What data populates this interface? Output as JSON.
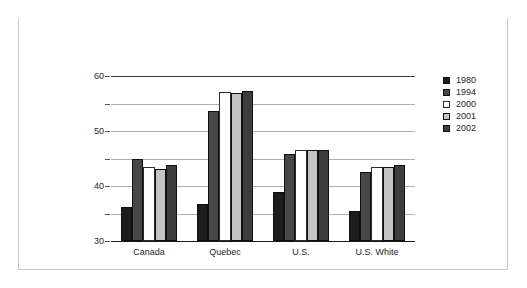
{
  "figure": {
    "title": "Figure 3.3 Out of Wedlock Births (percent of all births to unmarried mothers)"
  },
  "chart_data": {
    "type": "bar",
    "title": "Figure 3.3 Out of Wedlock Births (percent of all births to unmarried mothers)",
    "xlabel": "",
    "ylabel": "",
    "ylim": [
      0,
      60
    ],
    "yticks": [
      0,
      10,
      20,
      30,
      40,
      50,
      60
    ],
    "grid": true,
    "legend_position": "top-right",
    "categories": [
      "Canada",
      "Quebec",
      "U.S.",
      "U.S. White"
    ],
    "series": [
      {
        "name": "1980",
        "color": "#1c1c1c",
        "values": [
          12.5,
          13.3,
          18.0,
          11.0
        ]
      },
      {
        "name": "1994",
        "color": "#474747",
        "values": [
          30.0,
          47.3,
          31.7,
          25.0
        ]
      },
      {
        "name": "2000",
        "color": "#ffffff",
        "values": [
          27.0,
          54.3,
          33.0,
          26.8
        ]
      },
      {
        "name": "2001",
        "color": "#c4c4c4",
        "values": [
          26.2,
          53.7,
          33.0,
          27.0
        ]
      },
      {
        "name": "2002",
        "color": "#3c3c3c",
        "values": [
          27.5,
          54.5,
          33.0,
          27.8
        ]
      }
    ]
  },
  "axis": {
    "tick_labels": [
      "60",
      "50",
      "40",
      "30",
      "20",
      "10",
      "0"
    ]
  },
  "legend": {
    "entries": [
      {
        "label": "1980",
        "color": "#1c1c1c"
      },
      {
        "label": "1994",
        "color": "#474747"
      },
      {
        "label": "2000",
        "color": "#ffffff"
      },
      {
        "label": "2001",
        "color": "#c4c4c4"
      },
      {
        "label": "2002",
        "color": "#3c3c3c"
      }
    ]
  }
}
